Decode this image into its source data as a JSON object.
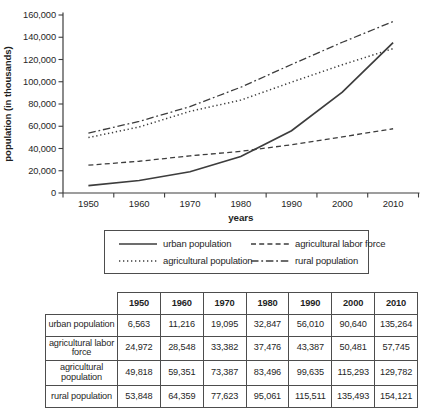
{
  "colors": {
    "line": "#3d3d3d",
    "border": "#4d4d4d",
    "text": "#1f1f1f"
  },
  "chart_data": {
    "type": "line",
    "title": "",
    "xlabel": "years",
    "ylabel": "population (in thousands)",
    "categories": [
      "1950",
      "1960",
      "1970",
      "1980",
      "1990",
      "2000",
      "2010"
    ],
    "ylim": [
      0,
      160000
    ],
    "grid": false,
    "legend_position": "boxed-below-chart",
    "line_color": "#3d3d3d",
    "y_ticks": [
      {
        "v": 0,
        "label": "0"
      },
      {
        "v": 20000,
        "label": "20,000"
      },
      {
        "v": 40000,
        "label": "40,000"
      },
      {
        "v": 60000,
        "label": "60,000"
      },
      {
        "v": 80000,
        "label": "80,000"
      },
      {
        "v": 100000,
        "label": "100,000"
      },
      {
        "v": 120000,
        "label": "120,000"
      },
      {
        "v": 140000,
        "label": "140,000"
      },
      {
        "v": 160000,
        "label": "160,000"
      }
    ],
    "series": [
      {
        "name": "urban population",
        "style": "solid",
        "values": [
          6563,
          11216,
          19095,
          32847,
          56010,
          90640,
          135264
        ]
      },
      {
        "name": "agricultural labor force",
        "style": "dashed",
        "values": [
          24972,
          28548,
          33382,
          37476,
          43387,
          50481,
          57745
        ]
      },
      {
        "name": "agricultural population",
        "style": "dotted",
        "values": [
          49818,
          59351,
          73387,
          83496,
          99635,
          115293,
          129782
        ]
      },
      {
        "name": "rural population",
        "style": "dashdot",
        "values": [
          53848,
          64359,
          77623,
          95061,
          115511,
          135493,
          154121
        ]
      }
    ]
  },
  "table": {
    "columns": [
      "1950",
      "1960",
      "1970",
      "1980",
      "1990",
      "2000",
      "2010"
    ],
    "rows": [
      {
        "label": "urban population",
        "values": [
          "6,563",
          "11,216",
          "19,095",
          "32,847",
          "56,010",
          "90,640",
          "135,264"
        ]
      },
      {
        "label": "agricultural labor force",
        "values": [
          "24,972",
          "28,548",
          "33,382",
          "37,476",
          "43,387",
          "50,481",
          "57,745"
        ]
      },
      {
        "label": "agricultural population",
        "values": [
          "49,818",
          "59,351",
          "73,387",
          "83,496",
          "99,635",
          "115,293",
          "129,782"
        ]
      },
      {
        "label": "rural population",
        "values": [
          "53,848",
          "64,359",
          "77,623",
          "95,061",
          "115,511",
          "135,493",
          "154,121"
        ]
      }
    ]
  }
}
